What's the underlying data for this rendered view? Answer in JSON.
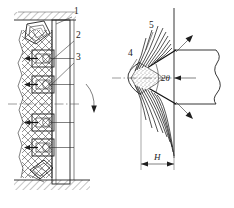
{
  "figure": {
    "title": "",
    "panels": [
      {
        "id": "left-panel",
        "name": "anchored-wall-section",
        "description": "Vertical cross-section of rock mass with anchored lining and bolt assemblies"
      },
      {
        "id": "right-panel",
        "name": "wedge-indentation-detail",
        "description": "Wedge indenter penetrating rock showing crushed core zone and radial fracture fan"
      }
    ],
    "callouts": [
      {
        "id": "1",
        "label": "1",
        "x": 74,
        "y": 14,
        "panel": "left-panel",
        "name": "callout-1"
      },
      {
        "id": "2",
        "label": "2",
        "x": 76,
        "y": 38,
        "panel": "left-panel",
        "name": "callout-2"
      },
      {
        "id": "3",
        "label": "3",
        "x": 76,
        "y": 60,
        "panel": "left-panel",
        "name": "callout-3"
      },
      {
        "id": "4",
        "label": "4",
        "x": 132,
        "y": 56,
        "panel": "right-panel",
        "name": "callout-4"
      },
      {
        "id": "5",
        "label": "5",
        "x": 150,
        "y": 28,
        "panel": "right-panel",
        "name": "callout-5"
      }
    ],
    "annotations": [
      {
        "id": "angle",
        "label": "2θ",
        "x": 166,
        "y": 75,
        "name": "angle-label-2theta"
      },
      {
        "id": "depth",
        "label": "H",
        "x": 158,
        "y": 155,
        "name": "depth-dimension-label-h"
      }
    ],
    "colors": {
      "line": "#1f1f1f",
      "thin_line": "#2b2b2b",
      "centerline": "#4a4a4a",
      "hatch": "#3a3a3a",
      "crushed_zone": "#2a2a2a",
      "background": "#ffffff"
    },
    "geometry": {
      "left_panel": {
        "wall_left": 22,
        "wall_right": 74,
        "lining_left": 52,
        "lining_right": 70,
        "top": 16,
        "bottom": 184,
        "bolt_rows": [
          {
            "y": 58,
            "name": "bolt-assembly-1"
          },
          {
            "y": 84,
            "name": "bolt-assembly-2"
          },
          {
            "y": 122,
            "name": "bolt-assembly-3"
          },
          {
            "y": 146,
            "name": "bolt-assembly-4"
          }
        ],
        "top_bracket": {
          "x": 28,
          "y": 20,
          "name": "top-angle-bracket"
        },
        "bottom_bracket": {
          "x": 30,
          "y": 162,
          "name": "bottom-angle-bracket"
        },
        "rotation_arrow": {
          "x": 92,
          "y": 88,
          "name": "rotation-direction-arrow"
        },
        "centerline_y": 104
      },
      "right_panel": {
        "tip_x": 131,
        "tip_y": 78,
        "axis_y": 78,
        "vertical_face_x": 174,
        "body_right": 232,
        "body_top": 50,
        "body_bottom": 104,
        "half_angle_deg": 26,
        "dimension_h": {
          "x1": 141,
          "x2": 174,
          "y": 164
        },
        "crack_count_upper": 9,
        "crack_count_lower": 9
      }
    }
  }
}
